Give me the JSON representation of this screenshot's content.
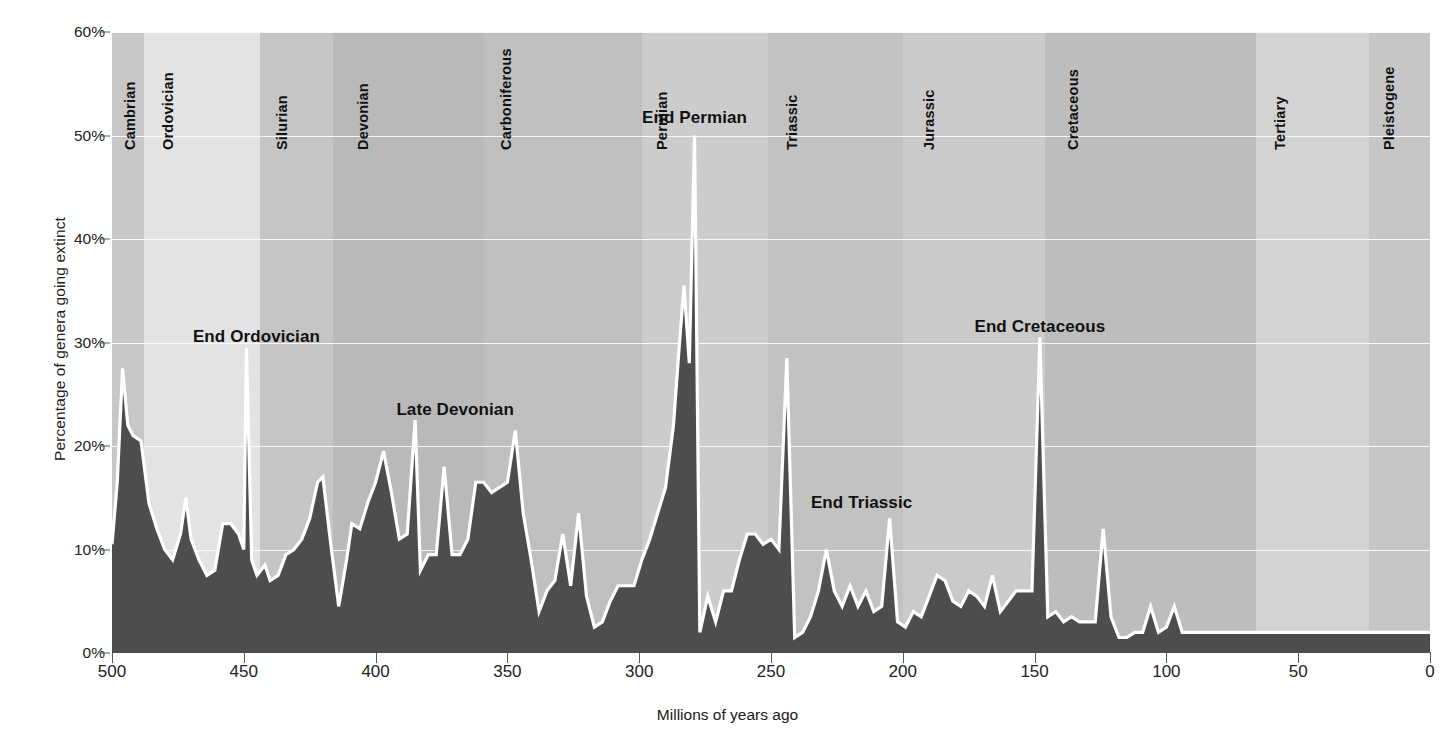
{
  "chart_data": {
    "type": "area",
    "title": "",
    "xlabel": "Millions of years ago",
    "ylabel": "Percentage of genera going extinct",
    "xlim": [
      500,
      0
    ],
    "ylim": [
      0,
      60
    ],
    "x_reversed": true,
    "grid": true,
    "xticks": [
      500,
      450,
      400,
      350,
      300,
      250,
      200,
      150,
      100,
      50,
      0
    ],
    "xticklabels": [
      "500",
      "450",
      "400",
      "350",
      "300",
      "250",
      "200",
      "150",
      "100",
      "50",
      "0"
    ],
    "yticks": [
      0,
      10,
      20,
      30,
      40,
      50,
      60
    ],
    "yticklabels": [
      "0%",
      "10%",
      "20%",
      "30%",
      "40%",
      "50%",
      "60%"
    ],
    "series_name": "Percentage of genera going extinct",
    "area_fill_color": "#4d4d4d",
    "line_color": "#ffffff",
    "points": [
      [
        500,
        10.5
      ],
      [
        498,
        16.5
      ],
      [
        496,
        27.5
      ],
      [
        494,
        22.0
      ],
      [
        492,
        21.0
      ],
      [
        489,
        20.5
      ],
      [
        486,
        14.5
      ],
      [
        483,
        12.0
      ],
      [
        480,
        10.0
      ],
      [
        477,
        9.0
      ],
      [
        474,
        11.5
      ],
      [
        472,
        15.0
      ],
      [
        470,
        11.0
      ],
      [
        467,
        9.0
      ],
      [
        464,
        7.5
      ],
      [
        461,
        8.0
      ],
      [
        458,
        12.5
      ],
      [
        455,
        12.5
      ],
      [
        452,
        11.5
      ],
      [
        450,
        10.0
      ],
      [
        449,
        29.5
      ],
      [
        447,
        9.0
      ],
      [
        445,
        7.5
      ],
      [
        442,
        8.5
      ],
      [
        440,
        7.0
      ],
      [
        437,
        7.5
      ],
      [
        434,
        9.5
      ],
      [
        431,
        10.0
      ],
      [
        428,
        11.0
      ],
      [
        425,
        13.0
      ],
      [
        422,
        16.5
      ],
      [
        420,
        17.0
      ],
      [
        417,
        10.5
      ],
      [
        414,
        4.5
      ],
      [
        411,
        9.0
      ],
      [
        409,
        12.5
      ],
      [
        406,
        12.0
      ],
      [
        403,
        14.5
      ],
      [
        400,
        16.5
      ],
      [
        397,
        19.5
      ],
      [
        394,
        15.5
      ],
      [
        391,
        11.0
      ],
      [
        388,
        11.5
      ],
      [
        385,
        22.5
      ],
      [
        383,
        8.0
      ],
      [
        380,
        9.5
      ],
      [
        377,
        9.5
      ],
      [
        374,
        18.0
      ],
      [
        371,
        9.5
      ],
      [
        368,
        9.5
      ],
      [
        365,
        11.0
      ],
      [
        362,
        16.5
      ],
      [
        359,
        16.5
      ],
      [
        356,
        15.5
      ],
      [
        353,
        16.0
      ],
      [
        350,
        16.5
      ],
      [
        347,
        21.5
      ],
      [
        344,
        13.5
      ],
      [
        341,
        9.0
      ],
      [
        338,
        4.0
      ],
      [
        335,
        6.0
      ],
      [
        332,
        7.0
      ],
      [
        329,
        11.5
      ],
      [
        326,
        6.5
      ],
      [
        323,
        13.5
      ],
      [
        320,
        5.5
      ],
      [
        317,
        2.5
      ],
      [
        314,
        3.0
      ],
      [
        311,
        5.0
      ],
      [
        308,
        6.5
      ],
      [
        305,
        6.5
      ],
      [
        302,
        6.5
      ],
      [
        299,
        9.0
      ],
      [
        296,
        11.0
      ],
      [
        293,
        13.5
      ],
      [
        290,
        16.0
      ],
      [
        287,
        22.0
      ],
      [
        285,
        29.0
      ],
      [
        283,
        35.5
      ],
      [
        281,
        28.0
      ],
      [
        279,
        50.0
      ],
      [
        277,
        2.0
      ],
      [
        274,
        5.5
      ],
      [
        271,
        3.0
      ],
      [
        268,
        6.0
      ],
      [
        265,
        6.0
      ],
      [
        262,
        9.0
      ],
      [
        259,
        11.5
      ],
      [
        256,
        11.5
      ],
      [
        253,
        10.5
      ],
      [
        250,
        11.0
      ],
      [
        247,
        10.0
      ],
      [
        244,
        28.5
      ],
      [
        241,
        1.5
      ],
      [
        238,
        2.0
      ],
      [
        235,
        3.5
      ],
      [
        232,
        6.0
      ],
      [
        229,
        10.0
      ],
      [
        226,
        6.0
      ],
      [
        223,
        4.5
      ],
      [
        220,
        6.5
      ],
      [
        217,
        4.5
      ],
      [
        214,
        6.0
      ],
      [
        211,
        4.0
      ],
      [
        208,
        4.5
      ],
      [
        205,
        13.0
      ],
      [
        202,
        3.0
      ],
      [
        199,
        2.5
      ],
      [
        196,
        4.0
      ],
      [
        193,
        3.5
      ],
      [
        190,
        5.5
      ],
      [
        187,
        7.5
      ],
      [
        184,
        7.0
      ],
      [
        181,
        5.0
      ],
      [
        178,
        4.5
      ],
      [
        175,
        6.0
      ],
      [
        172,
        5.5
      ],
      [
        169,
        4.5
      ],
      [
        166,
        7.5
      ],
      [
        163,
        4.0
      ],
      [
        160,
        5.0
      ],
      [
        157,
        6.0
      ],
      [
        154,
        6.0
      ],
      [
        151,
        6.0
      ],
      [
        148,
        30.5
      ],
      [
        145,
        3.5
      ],
      [
        142,
        4.0
      ],
      [
        139,
        3.0
      ],
      [
        136,
        3.5
      ],
      [
        133,
        3.0
      ],
      [
        130,
        3.0
      ],
      [
        127,
        3.0
      ],
      [
        124,
        12.0
      ],
      [
        121,
        3.5
      ],
      [
        118,
        1.5
      ],
      [
        115,
        1.5
      ],
      [
        112,
        2.0
      ],
      [
        109,
        2.0
      ],
      [
        106,
        4.5
      ],
      [
        103,
        2.0
      ],
      [
        100,
        2.5
      ],
      [
        97,
        4.5
      ],
      [
        94,
        2.0
      ]
    ],
    "annotations": [
      {
        "label": "End Ordovician",
        "x": 449,
        "y": 30.5
      },
      {
        "label": "Late Devonian",
        "x": 385,
        "y": 23.5
      },
      {
        "label": "End Permian",
        "x": 279,
        "y": 51.5
      },
      {
        "label": "End Triassic",
        "x": 205,
        "y": 14.5
      },
      {
        "label": "End Cretaceous",
        "x": 148,
        "y": 31.5
      }
    ],
    "periods": [
      {
        "name": "Cambrian",
        "start": 500,
        "end": 488,
        "color": "#c7c7c7"
      },
      {
        "name": "Ordovician",
        "start": 488,
        "end": 444,
        "color": "#e3e3e3"
      },
      {
        "name": "Silurian",
        "start": 444,
        "end": 416,
        "color": "#c5c5c5"
      },
      {
        "name": "Devonian",
        "start": 416,
        "end": 359,
        "color": "#b9b9b9"
      },
      {
        "name": "Carboniferous",
        "start": 359,
        "end": 299,
        "color": "#bfbfbf"
      },
      {
        "name": "Permian",
        "start": 299,
        "end": 251,
        "color": "#cccccc"
      },
      {
        "name": "Triassic",
        "start": 251,
        "end": 200,
        "color": "#c2c2c2"
      },
      {
        "name": "Jurassic",
        "start": 200,
        "end": 146,
        "color": "#cacaca"
      },
      {
        "name": "Cretaceous",
        "start": 146,
        "end": 66,
        "color": "#bdbdbd"
      },
      {
        "name": "Tertiary",
        "start": 66,
        "end": 23,
        "color": "#d3d3d3"
      },
      {
        "name": "Pleistogene",
        "start": 23,
        "end": 0,
        "color": "#c6c6c6"
      }
    ]
  }
}
